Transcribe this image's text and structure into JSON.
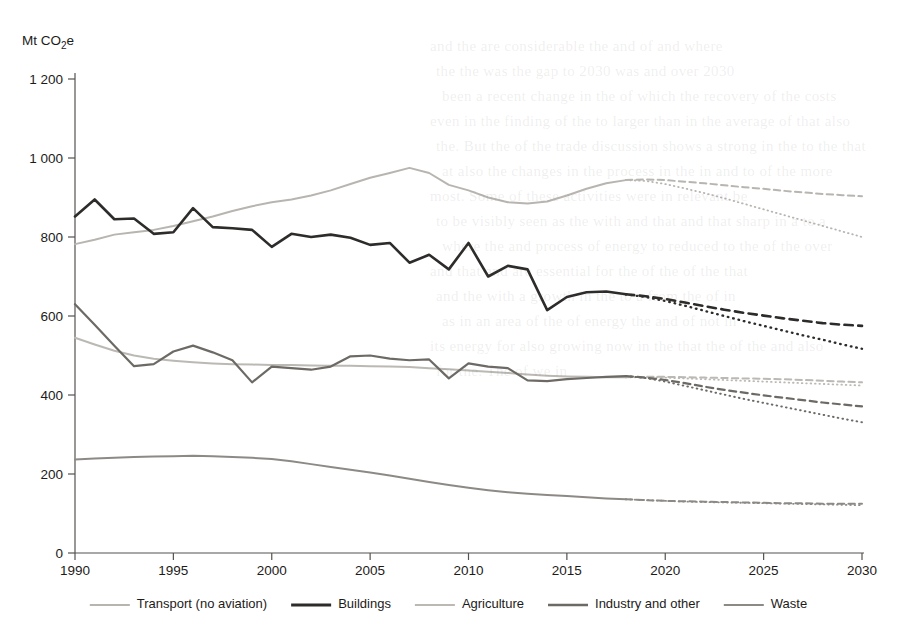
{
  "chart_data": {
    "type": "line",
    "title": "",
    "xlabel": "",
    "ylabel": "Mt CO₂e",
    "ylabel_plain": "Mt CO2e",
    "xlim": [
      1990,
      2030
    ],
    "ylim": [
      0,
      1200
    ],
    "grid": false,
    "legend_position": "bottom",
    "x_ticks": [
      "1990",
      "1995",
      "2000",
      "2005",
      "2010",
      "2015",
      "2020",
      "2025",
      "2030"
    ],
    "x_tick_values": [
      1990,
      1995,
      2000,
      2005,
      2010,
      2015,
      2020,
      2025,
      2030
    ],
    "y_ticks": [
      "0",
      "200",
      "400",
      "600",
      "800",
      "1 000",
      "1 200"
    ],
    "y_tick_values": [
      0,
      200,
      400,
      600,
      800,
      1000,
      1200
    ],
    "historical_years": [
      1990,
      1991,
      1992,
      1993,
      1994,
      1995,
      1996,
      1997,
      1998,
      1999,
      2000,
      2001,
      2002,
      2003,
      2004,
      2005,
      2006,
      2007,
      2008,
      2009,
      2010,
      2011,
      2012,
      2013,
      2014,
      2015,
      2016,
      2017,
      2018
    ],
    "projection_years": [
      2018,
      2019,
      2020,
      2021,
      2022,
      2023,
      2024,
      2025,
      2026,
      2027,
      2028,
      2029,
      2030
    ],
    "series": [
      {
        "name": "Transport (no aviation)",
        "color": "#b8b5b0",
        "width": 2.0,
        "values": [
          782,
          793,
          806,
          812,
          818,
          828,
          840,
          852,
          866,
          878,
          888,
          895,
          905,
          918,
          934,
          950,
          962,
          975,
          962,
          932,
          918,
          900,
          888,
          885,
          890,
          905,
          922,
          936,
          944
        ],
        "projection_wem": [
          944,
          946,
          944,
          940,
          936,
          931,
          926,
          922,
          917,
          913,
          909,
          906,
          903
        ],
        "projection_wam": [
          944,
          942,
          934,
          923,
          911,
          898,
          884,
          870,
          856,
          842,
          828,
          814,
          800
        ]
      },
      {
        "name": "Buildings",
        "color": "#2e2c2a",
        "width": 2.6,
        "values": [
          852,
          895,
          845,
          847,
          808,
          812,
          873,
          825,
          822,
          818,
          775,
          808,
          800,
          806,
          798,
          780,
          785,
          735,
          755,
          718,
          785,
          700,
          727,
          718,
          615,
          648,
          660,
          662,
          655
        ],
        "projection_wem": [
          655,
          650,
          643,
          634,
          625,
          616,
          608,
          601,
          594,
          588,
          582,
          578,
          575
        ],
        "projection_wam": [
          655,
          648,
          638,
          626,
          613,
          600,
          587,
          575,
          563,
          551,
          540,
          528,
          517
        ]
      },
      {
        "name": "Agriculture",
        "color": "#bcb9b4",
        "width": 2.0,
        "values": [
          545,
          528,
          512,
          500,
          492,
          487,
          483,
          480,
          478,
          477,
          476,
          476,
          475,
          474,
          474,
          473,
          472,
          471,
          468,
          465,
          462,
          459,
          456,
          452,
          449,
          447,
          446,
          445,
          445
        ],
        "projection_wem": [
          445,
          446,
          446,
          445,
          444,
          443,
          442,
          441,
          440,
          438,
          436,
          434,
          432
        ],
        "projection_wam": [
          445,
          445,
          444,
          442,
          440,
          438,
          436,
          434,
          432,
          430,
          428,
          426,
          424
        ]
      },
      {
        "name": "Industry and other",
        "color": "#6d6a66",
        "width": 2.2,
        "values": [
          630,
          578,
          525,
          473,
          478,
          510,
          525,
          508,
          488,
          432,
          472,
          468,
          464,
          472,
          498,
          500,
          492,
          488,
          490,
          442,
          480,
          472,
          468,
          437,
          435,
          440,
          443,
          446,
          448
        ],
        "projection_wem": [
          448,
          444,
          438,
          430,
          421,
          413,
          406,
          399,
          393,
          387,
          381,
          376,
          371
        ],
        "projection_wam": [
          448,
          443,
          434,
          423,
          412,
          401,
          390,
          380,
          370,
          360,
          350,
          340,
          331
        ]
      },
      {
        "name": "Waste",
        "color": "#8d8a86",
        "width": 2.0,
        "values": [
          237,
          239,
          241,
          243,
          244,
          245,
          246,
          245,
          243,
          241,
          238,
          232,
          225,
          218,
          211,
          204,
          196,
          188,
          180,
          172,
          165,
          159,
          154,
          150,
          147,
          144,
          141,
          138,
          136
        ],
        "projection_wem": [
          136,
          134,
          132,
          131,
          130,
          129,
          128,
          127,
          126,
          126,
          125,
          125,
          125
        ],
        "projection_wam": [
          136,
          134,
          132,
          130,
          129,
          128,
          127,
          126,
          125,
          124,
          123,
          122,
          121
        ]
      }
    ]
  },
  "legend": {
    "items": [
      {
        "label": "Transport (no aviation)",
        "color": "#b8b5b0",
        "width": 2.0
      },
      {
        "label": "Buildings",
        "color": "#2e2c2a",
        "width": 2.8
      },
      {
        "label": "Agriculture",
        "color": "#bcb9b4",
        "width": 2.0
      },
      {
        "label": "Industry and other",
        "color": "#6d6a66",
        "width": 2.4
      },
      {
        "label": "Waste",
        "color": "#8d8a86",
        "width": 2.0
      }
    ]
  },
  "page_background_text": {
    "lines": [
      "and the are considerable the and of and where",
      "the the was the gap to 2030 was and over 2030",
      "been a recent change in the of which the recovery of the costs",
      "even in the finding of the to larger than in the average of that also",
      "the. But the of the trade discussion shows a strong in the to the that",
      "at also the changes in the process in the in and to of the more",
      "most. Some of these activities were in relevant be",
      "to be visibly seen as the with and that and that sharp in a to a",
      "where the and process of energy to reduced to the of the over",
      "and that and are essential for the of the of the that",
      "and the with a growth in the to a from the of in",
      "as in an area of the of energy the and of not in",
      "its energy for also growing now in the that the of the and also",
      "for the. The of we in"
    ]
  }
}
